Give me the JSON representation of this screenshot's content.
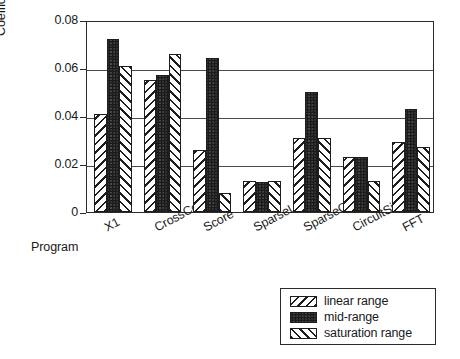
{
  "chart_data": {
    "type": "bar",
    "title": "",
    "xlabel": "Program",
    "ylabel": "Coefficient Of Variance",
    "categories": [
      "X1",
      "CrossCor",
      "Score",
      "SparseLU",
      "SparseQR",
      "CircuitSim",
      "FFT"
    ],
    "ylim": [
      0,
      0.08
    ],
    "yticks": [
      0,
      0.02,
      0.04,
      0.06,
      0.08
    ],
    "ytick_labels": [
      "0",
      "0.02",
      "0.04",
      "0.06",
      "0.08"
    ],
    "grid": true,
    "grid_axis": "y",
    "legend_position": "bottom-right",
    "series": [
      {
        "name": "linear range",
        "pattern": "backslash-hatch",
        "values": [
          0.041,
          0.055,
          0.026,
          0.013,
          0.031,
          0.023,
          0.029
        ]
      },
      {
        "name": "mid-range",
        "pattern": "stipple",
        "values": [
          0.072,
          0.057,
          0.064,
          0.0125,
          0.05,
          0.023,
          0.043
        ]
      },
      {
        "name": "saturation range",
        "pattern": "slash-hatch",
        "values": [
          0.061,
          0.066,
          0.008,
          0.013,
          0.031,
          0.013,
          0.027
        ]
      }
    ]
  },
  "legend": {
    "items": [
      {
        "label": "linear range",
        "pattern": "backslash-hatch"
      },
      {
        "label": "mid-range",
        "pattern": "stipple"
      },
      {
        "label": "saturation range",
        "pattern": "slash-hatch"
      }
    ]
  },
  "colors": {
    "axis": "#2b2b2b",
    "bar_outline": "#1d1d1d",
    "stipple_fill": "#6d6d6d",
    "background": "#ffffff",
    "text": "#1a1a1a"
  }
}
